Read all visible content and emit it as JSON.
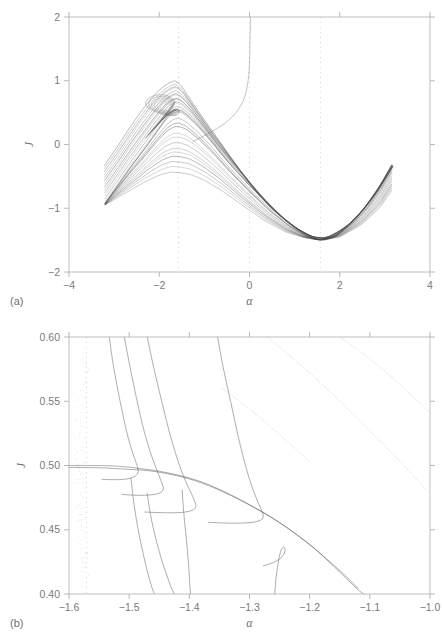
{
  "figure": {
    "panel_a_tag": "(a)",
    "panel_b_tag": "(b)",
    "background_color": "#ffffff",
    "curve_color": "#4a4a4a",
    "axis_color": "#b9b9b9",
    "grid_color": "#cfcfcf"
  },
  "chart_data": [
    {
      "id": "panel-a",
      "type": "line",
      "title": "",
      "panel_label": "(a)",
      "xlabel": "α",
      "ylabel": "J",
      "xlim": [
        -4,
        4
      ],
      "ylim": [
        -2,
        2
      ],
      "xticks": [
        -4,
        -2,
        0,
        2,
        4
      ],
      "xticklabels": [
        "−4",
        "−2",
        "0",
        "2",
        "4"
      ],
      "yticks": [
        -2,
        -1,
        0,
        1,
        2
      ],
      "yticklabels": [
        "−2",
        "−1",
        "0",
        "1",
        "2"
      ],
      "grid": "dotted vertical gridlines at x = -1.571, 0, 1.571",
      "vertical_gridlines": [
        -1.571,
        0,
        1.571
      ],
      "legend": "none",
      "description": "Bundle of invariant curves / KAM tori of a kicked-rotor style map. Curves sweep from a dense fan near alpha = -3.2 up to a cusp-like peak near (-1.6, 0.55), then descend through a broad minimum near (1.57, -1.5) and fan out again toward alpha = 3.1.",
      "series": [
        {
          "name": "main-envelope",
          "comment": "principal separatrix-like backbone",
          "x": [
            -3.2,
            -2.9,
            -2.6,
            -2.3,
            -2.0,
            -1.8,
            -1.65,
            -1.571,
            -1.45,
            -1.2,
            -0.9,
            -0.5,
            0.0,
            0.5,
            0.9,
            1.25,
            1.571,
            1.9,
            2.3,
            2.6,
            2.9,
            3.15
          ],
          "y": [
            -0.92,
            -0.62,
            -0.32,
            -0.04,
            0.26,
            0.45,
            0.53,
            0.54,
            0.5,
            0.34,
            0.1,
            -0.25,
            -0.64,
            -1.0,
            -1.25,
            -1.42,
            -1.5,
            -1.44,
            -1.2,
            -0.95,
            -0.63,
            -0.32
          ]
        },
        {
          "name": "upper-fan",
          "comment": "outermost curve of the left fan reaching J ~ 1.0",
          "x": [
            -3.22,
            -2.95,
            -2.7,
            -2.45,
            -2.2,
            -1.95,
            -1.78,
            -1.66,
            -1.58,
            -1.5,
            -1.35,
            -1.1,
            -0.8,
            -0.4,
            0.0,
            0.45,
            0.9,
            1.3,
            1.571,
            1.95,
            2.4,
            2.8,
            3.18
          ],
          "y": [
            -0.33,
            -0.06,
            0.21,
            0.47,
            0.7,
            0.88,
            0.96,
            0.99,
            0.96,
            0.9,
            0.74,
            0.48,
            0.18,
            -0.22,
            -0.62,
            -0.98,
            -1.25,
            -1.43,
            -1.49,
            -1.41,
            -1.13,
            -0.78,
            -0.35
          ]
        },
        {
          "name": "inner-loop",
          "comment": "tight spiral / island core near the cusp",
          "x": [
            -2.3,
            -2.05,
            -1.85,
            -1.7,
            -1.6,
            -1.55,
            -1.6,
            -1.72,
            -1.9,
            -2.1,
            -2.25,
            -2.3,
            -2.2,
            -2.0,
            -1.8,
            -1.65
          ],
          "y": [
            0.1,
            0.3,
            0.44,
            0.52,
            0.55,
            0.52,
            0.47,
            0.45,
            0.47,
            0.52,
            0.58,
            0.66,
            0.74,
            0.78,
            0.76,
            0.68
          ]
        },
        {
          "name": "separatrix-vertical",
          "comment": "near-vertical branch rising out of alpha ~ 0 up to J = 2",
          "x": [
            -1.25,
            -1.05,
            -0.82,
            -0.55,
            -0.3,
            -0.12,
            -0.03,
            0.0,
            0.01,
            0.02,
            0.02
          ],
          "y": [
            0.05,
            0.12,
            0.21,
            0.33,
            0.5,
            0.72,
            1.0,
            1.3,
            1.6,
            1.85,
            2.0
          ]
        },
        {
          "name": "lower-fan",
          "comment": "lowest member of the left fan",
          "x": [
            -3.2,
            -2.9,
            -2.6,
            -2.3,
            -2.0,
            -1.75,
            -1.55,
            -1.3,
            -1.0,
            -0.6,
            -0.2,
            0.3,
            0.8,
            1.2,
            1.571,
            2.0,
            2.5,
            2.9,
            3.15
          ],
          "y": [
            -0.95,
            -0.82,
            -0.7,
            -0.58,
            -0.48,
            -0.43,
            -0.44,
            -0.47,
            -0.56,
            -0.73,
            -0.93,
            -1.18,
            -1.37,
            -1.46,
            -1.5,
            -1.45,
            -1.25,
            -0.98,
            -0.72
          ]
        }
      ],
      "fan_count": 26
    },
    {
      "id": "panel-b",
      "type": "line",
      "title": "",
      "panel_label": "(b)",
      "xlabel": "α",
      "ylabel": "J",
      "xlim": [
        -1.6,
        -1.0
      ],
      "ylim": [
        0.4,
        0.6
      ],
      "xticks": [
        -1.6,
        -1.5,
        -1.4,
        -1.3,
        -1.2,
        -1.1,
        -1.0
      ],
      "xticklabels": [
        "−1.6",
        "−1.5",
        "−1.4",
        "−1.3",
        "−1.2",
        "−1.1",
        "−1.0"
      ],
      "yticks": [
        0.4,
        0.45,
        0.5,
        0.55,
        0.6
      ],
      "yticklabels": [
        "0.40",
        "0.45",
        "0.50",
        "0.55",
        "0.60"
      ],
      "grid": "dotted vertical gridline at x = -1.571",
      "vertical_gridlines": [
        -1.571
      ],
      "legend": "none",
      "description": "Magnification of the cusp region of panel (a). Several near-vertical invariant curves descend from the top of the frame and make U-turn hooks at successively lower J, each re-joining the dominant descending envelope that starts flat at J = 0.50 near alpha = -1.57 and falls to J = 0.40 near alpha = -1.11. Faint chevron-dashed lines cross the upper right. A chaotic scatter of points clusters along the alpha = -1.57 gridline.",
      "series": [
        {
          "name": "envelope-main",
          "x": [
            -1.6,
            -1.571,
            -1.52,
            -1.48,
            -1.45,
            -1.41,
            -1.37,
            -1.32,
            -1.27,
            -1.23,
            -1.19,
            -1.16,
            -1.14,
            -1.12,
            -1.11
          ],
          "y": [
            0.5,
            0.5,
            0.4995,
            0.4975,
            0.4955,
            0.4915,
            0.4855,
            0.4745,
            0.4615,
            0.449,
            0.4345,
            0.4215,
            0.4125,
            0.4035,
            0.4
          ]
        },
        {
          "name": "envelope-shadow",
          "x": [
            -1.6,
            -1.55,
            -1.5,
            -1.46,
            -1.42,
            -1.38,
            -1.33,
            -1.28,
            -1.24,
            -1.2,
            -1.17,
            -1.14,
            -1.12
          ],
          "y": [
            0.4985,
            0.4982,
            0.497,
            0.4955,
            0.492,
            0.4865,
            0.4765,
            0.464,
            0.4525,
            0.4385,
            0.4265,
            0.414,
            0.4045
          ]
        },
        {
          "name": "hook-1",
          "comment": "leftmost descending branch, turns near J = 0.498",
          "x": [
            -1.533,
            -1.528,
            -1.521,
            -1.512,
            -1.503,
            -1.495,
            -1.489,
            -1.486,
            -1.485,
            -1.487,
            -1.492,
            -1.499,
            -1.508,
            -1.519,
            -1.532,
            -1.545
          ],
          "y": [
            0.6,
            0.583,
            0.564,
            0.543,
            0.524,
            0.511,
            0.503,
            0.4985,
            0.4955,
            0.493,
            0.4912,
            0.49,
            0.4893,
            0.489,
            0.489,
            0.4892
          ]
        },
        {
          "name": "hook-2",
          "x": [
            -1.508,
            -1.5,
            -1.49,
            -1.478,
            -1.466,
            -1.456,
            -1.449,
            -1.445,
            -1.443,
            -1.445,
            -1.45,
            -1.458,
            -1.469,
            -1.482,
            -1.496,
            -1.512
          ],
          "y": [
            0.6,
            0.58,
            0.557,
            0.532,
            0.512,
            0.499,
            0.4905,
            0.4855,
            0.4825,
            0.48,
            0.4785,
            0.4775,
            0.477,
            0.4768,
            0.477,
            0.4775
          ]
        },
        {
          "name": "hook-3",
          "x": [
            -1.47,
            -1.46,
            -1.447,
            -1.432,
            -1.417,
            -1.405,
            -1.396,
            -1.391,
            -1.389,
            -1.391,
            -1.397,
            -1.407,
            -1.42,
            -1.436,
            -1.454,
            -1.474
          ],
          "y": [
            0.6,
            0.578,
            0.552,
            0.524,
            0.501,
            0.4865,
            0.4775,
            0.472,
            0.4688,
            0.4663,
            0.4648,
            0.4638,
            0.4633,
            0.4632,
            0.4634,
            0.4638
          ]
        },
        {
          "name": "hook-4",
          "comment": "large hook turning near alpha = -1.28",
          "x": [
            -1.353,
            -1.344,
            -1.331,
            -1.317,
            -1.303,
            -1.292,
            -1.284,
            -1.279,
            -1.277,
            -1.279,
            -1.285,
            -1.295,
            -1.309,
            -1.326,
            -1.346,
            -1.368
          ],
          "y": [
            0.6,
            0.577,
            0.549,
            0.519,
            0.494,
            0.4785,
            0.4695,
            0.464,
            0.4608,
            0.4583,
            0.4568,
            0.4558,
            0.4553,
            0.4551,
            0.4553,
            0.4558
          ]
        },
        {
          "name": "hook-5",
          "comment": "low hook near alpha = -1.255, J ~ 0.436",
          "x": [
            -1.258,
            -1.256,
            -1.253,
            -1.25,
            -1.247,
            -1.244,
            -1.242,
            -1.241,
            -1.242,
            -1.245,
            -1.25,
            -1.257,
            -1.266,
            -1.277
          ],
          "y": [
            0.4,
            0.412,
            0.422,
            0.43,
            0.4345,
            0.4365,
            0.4362,
            0.4345,
            0.432,
            0.4295,
            0.4272,
            0.4252,
            0.4235,
            0.422
          ]
        },
        {
          "name": "vertical-strand-a",
          "x": [
            -1.497,
            -1.492,
            -1.485,
            -1.477,
            -1.47,
            -1.464,
            -1.46,
            -1.458
          ],
          "y": [
            0.49,
            0.47,
            0.45,
            0.432,
            0.418,
            0.408,
            0.402,
            0.4
          ]
        },
        {
          "name": "vertical-strand-b",
          "x": [
            -1.47,
            -1.463,
            -1.454,
            -1.445,
            -1.437,
            -1.431,
            -1.427,
            -1.425
          ],
          "y": [
            0.478,
            0.458,
            0.44,
            0.425,
            0.414,
            0.406,
            0.402,
            0.4
          ]
        },
        {
          "name": "vertical-strand-c",
          "x": [
            -1.412,
            -1.409,
            -1.405,
            -1.402,
            -1.4,
            -1.399,
            -1.398
          ],
          "y": [
            0.481,
            0.462,
            0.443,
            0.427,
            0.414,
            0.405,
            0.4
          ]
        },
        {
          "name": "chevron-dash-upper",
          "comment": "faint dash-dot line crossing top right",
          "x": [
            -1.27,
            -1.2,
            -1.13,
            -1.06,
            -1.0
          ],
          "y": [
            0.6,
            0.572,
            0.541,
            0.508,
            0.478
          ]
        },
        {
          "name": "chevron-dash-lower",
          "x": [
            -1.15,
            -1.1,
            -1.05,
            -1.0
          ],
          "y": [
            0.6,
            0.583,
            0.563,
            0.541
          ]
        },
        {
          "name": "chevron-dash-faint-left",
          "x": [
            -1.345,
            -1.3,
            -1.25,
            -1.2
          ],
          "y": [
            0.56,
            0.544,
            0.524,
            0.503
          ]
        }
      ],
      "scatter_band": {
        "comment": "chaotic layer hugging the alpha = -1.571 gridline",
        "alpha_center": -1.571,
        "alpha_spread": 0.018,
        "j_range": [
          0.405,
          0.585
        ],
        "point_count": 150
      }
    }
  ]
}
